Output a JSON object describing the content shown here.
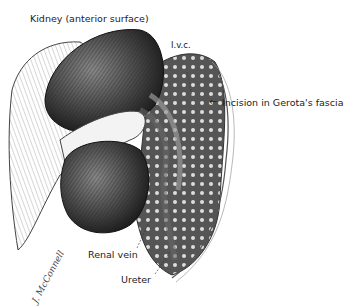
{
  "figure": {
    "labels": {
      "kidney": "Kidney (anterior surface)",
      "ivc": "I.v.c.",
      "incision": "Incision in Gerota's fascia",
      "renal_vein": "Renal vein",
      "ureter": "Ureter"
    },
    "signature": "J. McConnell",
    "arrow_glyph": "←"
  }
}
